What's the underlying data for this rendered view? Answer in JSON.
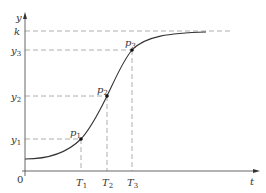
{
  "diagram": {
    "type": "logistic-curve",
    "axes": {
      "x_label": "t",
      "y_label": "y",
      "origin_label": "0"
    },
    "y_levels": [
      {
        "name": "k",
        "label": "k",
        "sub": ""
      },
      {
        "name": "y3",
        "label": "y",
        "sub": "3"
      },
      {
        "name": "y2",
        "label": "y",
        "sub": "2"
      },
      {
        "name": "y1",
        "label": "y",
        "sub": "1"
      }
    ],
    "x_ticks": [
      {
        "name": "T1",
        "label": "T",
        "sub": "1"
      },
      {
        "name": "T2",
        "label": "T",
        "sub": "2"
      },
      {
        "name": "T3",
        "label": "T",
        "sub": "3"
      }
    ],
    "points": [
      {
        "name": "p1",
        "label": "p",
        "sub": "1"
      },
      {
        "name": "p2",
        "label": "p",
        "sub": "2"
      },
      {
        "name": "p3",
        "label": "p",
        "sub": "3"
      }
    ],
    "colors": {
      "curve": "#333333",
      "axis": "#555555",
      "dashed": "#999999",
      "point": "#111111",
      "text": "#333333"
    }
  }
}
